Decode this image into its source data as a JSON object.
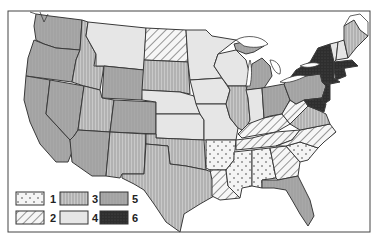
{
  "map": {
    "type": "choropleth",
    "region": "United States (contiguous)",
    "categories": [
      {
        "id": 1,
        "label": "1",
        "pattern": "dotted"
      },
      {
        "id": 2,
        "label": "2",
        "pattern": "diagonal-hatch"
      },
      {
        "id": 3,
        "label": "3",
        "pattern": "vertical-lines"
      },
      {
        "id": 4,
        "label": "4",
        "pattern": "light-gray"
      },
      {
        "id": 5,
        "label": "5",
        "pattern": "medium-gray"
      },
      {
        "id": 6,
        "label": "6",
        "pattern": "dark-black"
      }
    ],
    "states": {
      "WA": 5,
      "OR": 5,
      "CA": 5,
      "NV": 5,
      "ID": 3,
      "MT": 4,
      "WY": 5,
      "UT": 3,
      "AZ": 5,
      "CO": 5,
      "NM": 3,
      "ND": 2,
      "SD": 3,
      "NE": 4,
      "KS": 4,
      "OK": 3,
      "TX": 3,
      "MN": 4,
      "IA": 4,
      "MO": 4,
      "AR": 1,
      "LA": 2,
      "WI": 4,
      "IL": 3,
      "MI": 5,
      "IN": 4,
      "OH": 5,
      "KY": 2,
      "TN": 2,
      "MS": 1,
      "AL": 1,
      "GA": 2,
      "FL": 5,
      "SC": 1,
      "NC": 2,
      "VA": 3,
      "WV": 2,
      "PA": 5,
      "NY": 6,
      "NJ": 6,
      "MD": 6,
      "DE": 6,
      "CT": 6,
      "RI": 6,
      "MA": 6,
      "VT": 4,
      "NH": 4,
      "ME": 3
    }
  },
  "legend": {
    "items": [
      {
        "label": "1",
        "category": 1
      },
      {
        "label": "2",
        "category": 2
      },
      {
        "label": "3",
        "category": 3
      },
      {
        "label": "4",
        "category": 4
      },
      {
        "label": "5",
        "category": 5
      },
      {
        "label": "6",
        "category": 6
      }
    ]
  }
}
